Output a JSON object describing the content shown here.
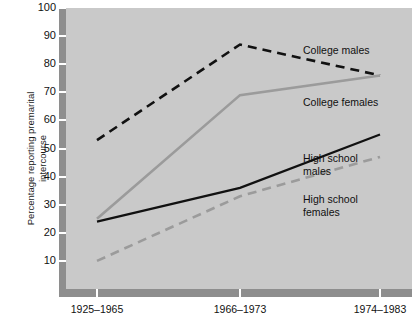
{
  "chart_data": {
    "type": "line",
    "title": "",
    "xlabel": "",
    "ylabel": "Percentage reporting premarital\nintercourse",
    "categories": [
      "1925–1965",
      "1966–1973",
      "1974–1983"
    ],
    "ylim": [
      0,
      100
    ],
    "yticks": [
      10,
      20,
      30,
      40,
      50,
      60,
      70,
      80,
      90,
      100
    ],
    "ytick_labels": [
      "10",
      "20",
      "30",
      "40",
      "50",
      "60",
      "70",
      "80",
      "90",
      "100"
    ],
    "grid": false,
    "legend_position": "inline-right-of-lines",
    "series": [
      {
        "name": "College males",
        "label_text": "College males",
        "values": [
          53,
          87,
          76
        ],
        "color": "#111111",
        "style": "dashed",
        "width": 2.6
      },
      {
        "name": "College females",
        "label_text": "College females",
        "values": [
          25,
          69,
          76
        ],
        "color": "#9b9b9b",
        "style": "solid",
        "width": 2.6
      },
      {
        "name": "High school males",
        "label_text": "High school\nmales",
        "values": [
          24,
          36,
          55
        ],
        "color": "#111111",
        "style": "solid",
        "width": 2.2
      },
      {
        "name": "High school females",
        "label_text": "High school\nfemales",
        "values": [
          10,
          33,
          47
        ],
        "color": "#9b9b9b",
        "style": "dashed",
        "width": 2.6
      }
    ]
  },
  "axes": {
    "y_axis_title": "Percentage reporting premarital\nintercourse",
    "y_tick_labels": [
      "100",
      "90",
      "80",
      "70",
      "60",
      "50",
      "40",
      "30",
      "20",
      "10"
    ],
    "x_tick_labels": [
      "1925–1965",
      "1966–1973",
      "1974–1983"
    ]
  },
  "colors": {
    "plot_background": "#c9c9c9",
    "axis_band": "#8e8e8e",
    "tick_mark": "#ffffff",
    "dark_series": "#111111",
    "gray_series": "#9b9b9b",
    "text": "#111111",
    "page_background": "#ffffff"
  },
  "annotations": {
    "college_males_label": "College males",
    "college_females_label": "College females",
    "high_school_males_label": "High school\nmales",
    "high_school_females_label": "High school\nfemales"
  }
}
